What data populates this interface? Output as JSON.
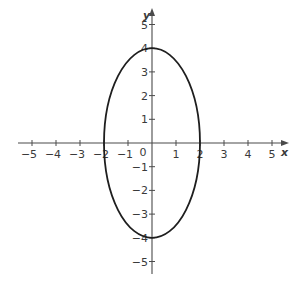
{
  "chart_data": {
    "type": "line",
    "title": "",
    "xlabel": "x",
    "ylabel": "y",
    "xlim": [
      -5,
      5
    ],
    "ylim": [
      -5,
      5
    ],
    "grid": false,
    "x_ticks": [
      -5,
      -4,
      -3,
      -2,
      -1,
      0,
      1,
      2,
      3,
      4,
      5
    ],
    "y_ticks": [
      -5,
      -4,
      -3,
      -2,
      -1,
      1,
      2,
      3,
      4,
      5
    ],
    "series": [
      {
        "name": "ellipse",
        "equation": "x^2/4 + y^2/16 = 1",
        "center": [
          0,
          0
        ],
        "semi_axis_x": 2,
        "semi_axis_y": 4,
        "key_points": [
          [
            2,
            0
          ],
          [
            0,
            4
          ],
          [
            -2,
            0
          ],
          [
            0,
            -4
          ]
        ]
      }
    ]
  },
  "labels": {
    "x_axis": "x",
    "y_axis": "y",
    "origin": "0"
  },
  "colors": {
    "curve": "#1e1e1e",
    "axis": "#4a4a4a",
    "text": "#3a3a3a"
  }
}
